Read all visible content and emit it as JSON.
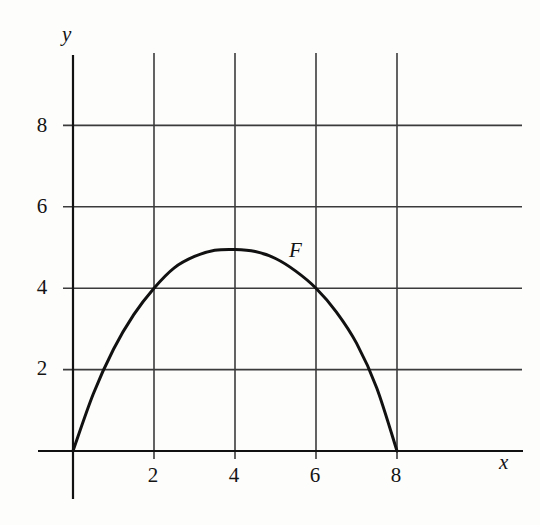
{
  "figure": {
    "background_color": "#fdfdfc",
    "ink_color": "#141414"
  },
  "axes": {
    "x_axis_label": "x",
    "y_axis_label": "y"
  },
  "annotations": {
    "curve_label": "F"
  },
  "ticks": {
    "x": [
      "2",
      "4",
      "6",
      "8"
    ],
    "y": [
      "2",
      "4",
      "6",
      "8"
    ]
  },
  "chart_data": {
    "type": "line",
    "title": "",
    "xlabel": "x",
    "ylabel": "y",
    "xlim": [
      -0.3,
      11.1
    ],
    "ylim": [
      -1.4,
      9.8
    ],
    "xticks": [
      2,
      4,
      6,
      8
    ],
    "yticks": [
      2,
      4,
      6,
      8
    ],
    "grid": true,
    "grid_color": "#3b3b3b",
    "legend": "none",
    "series": [
      {
        "name": "F",
        "label": "F",
        "color": "#111111",
        "line_width": 3,
        "annotation_at": {
          "x": 5.35,
          "y": 5.0
        },
        "x": [
          0,
          0.5,
          1,
          1.5,
          2,
          2.5,
          3,
          3.5,
          4,
          4.5,
          5,
          5.5,
          6,
          6.5,
          7,
          7.5,
          8
        ],
        "y": [
          0,
          1.4,
          2.5,
          3.35,
          4.0,
          4.5,
          4.78,
          4.93,
          4.95,
          4.9,
          4.73,
          4.42,
          4.0,
          3.42,
          2.65,
          1.55,
          0
        ]
      }
    ]
  },
  "geometry": {
    "origin_px": {
      "x": 73,
      "y": 451
    },
    "px_per_unit_x": 40.5,
    "px_per_unit_y": 40.7,
    "vertical_gridlines_x_units": [
      2,
      4,
      6,
      8
    ],
    "horizontal_gridlines_y_units": [
      2,
      4,
      6,
      8
    ],
    "vertical_grid_top_px": 53,
    "vertical_grid_bottom_px": 459,
    "horizontal_grid_left_px": 63,
    "horizontal_grid_right_px": 522,
    "x_axis_left_px": 38,
    "x_axis_right_px": 523,
    "y_axis_top_px": 55,
    "y_axis_bottom_px": 499
  }
}
